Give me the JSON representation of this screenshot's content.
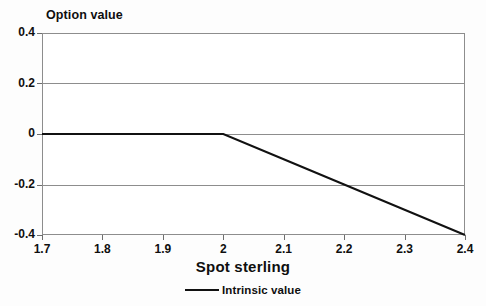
{
  "chart_data": {
    "type": "line",
    "title": "",
    "xlabel": "Spot sterling",
    "ylabel": "Option value",
    "xlim": [
      1.7,
      2.4
    ],
    "ylim": [
      -0.4,
      0.4
    ],
    "xticks": [
      1.7,
      1.8,
      1.9,
      2.0,
      2.1,
      2.2,
      2.3,
      2.4
    ],
    "xticklabels": [
      "1.7",
      "1.8",
      "1.9",
      "2",
      "2.1",
      "2.2",
      "2.3",
      "2.4"
    ],
    "yticks": [
      0.4,
      0.2,
      0,
      -0.2,
      -0.4
    ],
    "yticklabels": [
      "0.4",
      "0.2",
      "0",
      "-0.2",
      "-0.4"
    ],
    "grid": "horizontal",
    "gridlines_y": [
      0.2,
      0,
      -0.2
    ],
    "legend_position": "bottom-center",
    "series": [
      {
        "name": "Intrinsic value",
        "color": "#111111",
        "x": [
          1.7,
          1.8,
          1.9,
          2.0,
          2.1,
          2.2,
          2.3,
          2.4
        ],
        "values": [
          0,
          0,
          0,
          0,
          -0.1,
          -0.2,
          -0.3,
          -0.4
        ]
      }
    ],
    "annotations": []
  },
  "legend": {
    "entries": [
      {
        "label": "Intrinsic value",
        "color": "#111111"
      }
    ]
  },
  "colors": {
    "axis": "#8d8d8d",
    "tick": "#6d6d6d",
    "text": "#0f0f0f",
    "line": "#111111",
    "background": "#fdfdfd",
    "plot_background": "#ffffff"
  }
}
